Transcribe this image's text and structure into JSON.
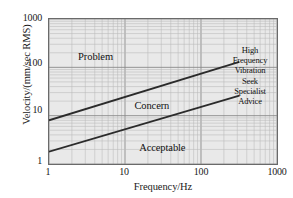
{
  "chart_data": {
    "type": "line",
    "title": "",
    "xlabel": "Frequency/Hz",
    "ylabel": "Velocity/(mm/sec RMS)",
    "xscale": "log",
    "yscale": "log",
    "xlim": [
      1,
      1000
    ],
    "ylim": [
      1,
      1000
    ],
    "grid": true,
    "grid_minor": true,
    "legend": "none",
    "xticks": [
      "1",
      "10",
      "100",
      "1000"
    ],
    "xtick_values": [
      1,
      10,
      100,
      1000
    ],
    "yticks": [
      "1",
      "10",
      "100",
      "1000"
    ],
    "ytick_values": [
      1,
      10,
      100,
      1000
    ],
    "series": [
      {
        "name": "Problem / Concern boundary",
        "x": [
          1,
          320
        ],
        "y": [
          8,
          130
        ]
      },
      {
        "name": "Concern / Acceptable boundary",
        "x": [
          1,
          320
        ],
        "y": [
          1.8,
          26
        ]
      }
    ],
    "annotations": [
      {
        "text": "Problem",
        "x": 2.4,
        "y": 170
      },
      {
        "text": "Concern",
        "x": 13,
        "y": 17
      },
      {
        "text": "Acceptable",
        "x": 15,
        "y": 2.3
      },
      {
        "text": "High Frequency Vibration Seek Specialist Advice",
        "x": 600,
        "y": 60
      }
    ],
    "colors": {
      "plot_background": "#e9e9e9",
      "grid_major": "#8a8a8a",
      "grid_minor": "#b9b9b9",
      "axis_frame": "#6a6a6a",
      "series_line": "#2b2b2b",
      "text": "#111111",
      "page_background": "#ffffff"
    }
  },
  "axes": {
    "x_title": "Frequency/Hz",
    "y_title": "Velocity/(mm/sec RMS)",
    "x_tick_labels": [
      "1",
      "10",
      "100",
      "1000"
    ],
    "y_tick_labels": [
      "1000",
      "100",
      "10",
      "1"
    ]
  },
  "zones": {
    "problem": "Problem",
    "concern": "Concern",
    "acceptable": "Acceptable"
  },
  "advice": {
    "lines": [
      "High",
      "Frequency",
      "Vibration",
      "Seek",
      "Specialist",
      "Advice"
    ]
  }
}
